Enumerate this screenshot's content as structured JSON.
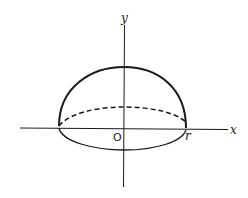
{
  "diagram": {
    "labels": {
      "x_axis": "x",
      "y_axis": "y",
      "origin": "O",
      "radius": "r"
    },
    "colors": {
      "stroke": "#1a1a1a",
      "background": "#ffffff"
    },
    "elements": [
      {
        "type": "axis",
        "name": "x-axis",
        "orientation": "horizontal"
      },
      {
        "type": "axis",
        "name": "y-axis",
        "orientation": "vertical"
      },
      {
        "type": "arc",
        "name": "hemisphere-outline",
        "style": "solid-bold"
      },
      {
        "type": "ellipse-arc",
        "name": "base-ellipse-back",
        "style": "dashed"
      },
      {
        "type": "ellipse-arc",
        "name": "base-ellipse-front",
        "style": "solid"
      }
    ]
  }
}
